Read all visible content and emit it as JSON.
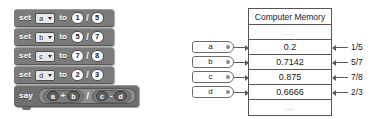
{
  "blocks": {
    "set_label": "set",
    "to_label": "to",
    "say_label": "say",
    "divide_symbol": "/",
    "dropdown_icon": "chevron-down-icon",
    "rows": [
      {
        "variable": "a",
        "numerator": "1",
        "denominator": "5"
      },
      {
        "variable": "b",
        "numerator": "5",
        "denominator": "7"
      },
      {
        "variable": "c",
        "numerator": "7",
        "denominator": "8"
      },
      {
        "variable": "d",
        "numerator": "2",
        "denominator": "3"
      }
    ],
    "expression": {
      "left_group": {
        "first": "a",
        "operator": "+",
        "second": "b"
      },
      "operator": "/",
      "right_group": {
        "first": "c",
        "operator": "-",
        "second": "d"
      }
    }
  },
  "memory": {
    "title": "Computer Memory",
    "top_ellipsis": "...",
    "bottom_ellipsis": "...",
    "cells": [
      {
        "tag": "a",
        "value": "0.2",
        "fraction": "1/5"
      },
      {
        "tag": "b",
        "value": "0.7142",
        "fraction": "5/7"
      },
      {
        "tag": "c",
        "value": "0.875",
        "fraction": "7/8"
      },
      {
        "tag": "d",
        "value": "0.6666",
        "fraction": "2/3"
      }
    ]
  },
  "colors": {
    "block_body": "#7b7b7b",
    "say_block": "#6f6f6f",
    "reporter_outer": "#8d8d8d",
    "reporter_inner": "#7a7a7a",
    "variable_oval": "#5e5e5e",
    "table_border": "#555555",
    "page_background": "#ffffff"
  }
}
